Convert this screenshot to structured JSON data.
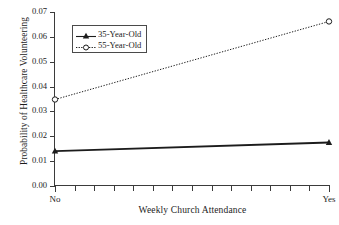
{
  "chart_data": {
    "type": "line",
    "title": "",
    "xlabel": "Weekly Church Attendance",
    "ylabel": "Probability of Healthcare Volunteering",
    "categories": [
      "No",
      "Yes"
    ],
    "xtick_labels": [
      "No",
      "Yes"
    ],
    "ytick_labels": [
      "0.00",
      "0.01",
      "0.02",
      "0.03",
      "0.04",
      "0.05",
      "0.06",
      "0.07"
    ],
    "ylim": [
      0.0,
      0.07
    ],
    "xlim": [
      0,
      1
    ],
    "grid": false,
    "legend_position": "upper-left-inside",
    "minor_xticks": 14,
    "series": [
      {
        "name": "35-Year-Old",
        "marker": "filled-triangle",
        "linestyle": "solid",
        "color": "#1c1c1c",
        "values": [
          0.014,
          0.0175
        ]
      },
      {
        "name": "55-Year-Old",
        "marker": "open-circle",
        "linestyle": "dotted",
        "color": "#1c1c1c",
        "values": [
          0.0348,
          0.0662
        ]
      }
    ]
  },
  "legend": {
    "entries": [
      {
        "label": "35-Year-Old"
      },
      {
        "label": "55-Year-Old"
      }
    ]
  }
}
